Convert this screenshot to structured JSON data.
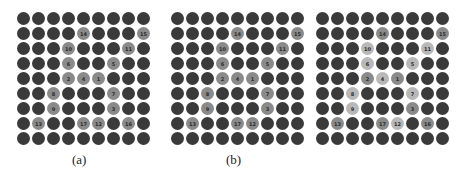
{
  "figure": {
    "grid_size": 9,
    "panels": [
      {
        "id": "a",
        "caption": "(a)",
        "left": 17,
        "highlighted": [
          {
            "row": 1,
            "col": 4,
            "label": "14",
            "shade": "medium"
          },
          {
            "row": 1,
            "col": 8,
            "label": "15",
            "shade": "medium"
          },
          {
            "row": 2,
            "col": 3,
            "label": "10",
            "shade": "medium"
          },
          {
            "row": 2,
            "col": 7,
            "label": "11",
            "shade": "medium"
          },
          {
            "row": 3,
            "col": 3,
            "label": "6",
            "shade": "medium"
          },
          {
            "row": 3,
            "col": 6,
            "label": "5",
            "shade": "medium"
          },
          {
            "row": 4,
            "col": 3,
            "label": "2",
            "shade": "medium"
          },
          {
            "row": 4,
            "col": 4,
            "label": "4",
            "shade": "medium"
          },
          {
            "row": 4,
            "col": 5,
            "label": "1",
            "shade": "medium"
          },
          {
            "row": 5,
            "col": 2,
            "label": "8",
            "shade": "medium"
          },
          {
            "row": 5,
            "col": 6,
            "label": "7",
            "shade": "medium"
          },
          {
            "row": 6,
            "col": 2,
            "label": "9",
            "shade": "medium"
          },
          {
            "row": 6,
            "col": 6,
            "label": "3",
            "shade": "medium"
          },
          {
            "row": 7,
            "col": 1,
            "label": "13",
            "shade": "medium"
          },
          {
            "row": 7,
            "col": 4,
            "label": "17",
            "shade": "medium"
          },
          {
            "row": 7,
            "col": 5,
            "label": "12",
            "shade": "medium"
          },
          {
            "row": 7,
            "col": 7,
            "label": "16",
            "shade": "medium"
          }
        ]
      },
      {
        "id": "b",
        "caption": "(b)",
        "left": 171,
        "highlighted": [
          {
            "row": 1,
            "col": 4,
            "label": "14",
            "shade": "medium"
          },
          {
            "row": 1,
            "col": 8,
            "label": "15",
            "shade": "medium"
          },
          {
            "row": 2,
            "col": 3,
            "label": "10",
            "shade": "medium"
          },
          {
            "row": 2,
            "col": 7,
            "label": "11",
            "shade": "medium"
          },
          {
            "row": 3,
            "col": 3,
            "label": "6",
            "shade": "medium"
          },
          {
            "row": 3,
            "col": 6,
            "label": "5",
            "shade": "medium"
          },
          {
            "row": 4,
            "col": 3,
            "label": "2",
            "shade": "medium"
          },
          {
            "row": 4,
            "col": 4,
            "label": "4",
            "shade": "medium"
          },
          {
            "row": 4,
            "col": 5,
            "label": "1",
            "shade": "medium"
          },
          {
            "row": 5,
            "col": 2,
            "label": "8",
            "shade": "medium"
          },
          {
            "row": 5,
            "col": 6,
            "label": "7",
            "shade": "medium"
          },
          {
            "row": 6,
            "col": 2,
            "label": "9",
            "shade": "medium"
          },
          {
            "row": 6,
            "col": 6,
            "label": "3",
            "shade": "medium"
          },
          {
            "row": 7,
            "col": 1,
            "label": "13",
            "shade": "medium"
          },
          {
            "row": 7,
            "col": 4,
            "label": "17",
            "shade": "medium"
          },
          {
            "row": 7,
            "col": 5,
            "label": "12",
            "shade": "medium"
          }
        ]
      },
      {
        "id": "c",
        "caption": "",
        "left": 316,
        "highlighted": [
          {
            "row": 1,
            "col": 4,
            "label": "14",
            "shade": "medium"
          },
          {
            "row": 1,
            "col": 8,
            "label": "15",
            "shade": "medium"
          },
          {
            "row": 2,
            "col": 3,
            "label": "10",
            "shade": "light"
          },
          {
            "row": 2,
            "col": 7,
            "label": "11",
            "shade": "light"
          },
          {
            "row": 3,
            "col": 3,
            "label": "6",
            "shade": "light"
          },
          {
            "row": 3,
            "col": 6,
            "label": "5",
            "shade": "light"
          },
          {
            "row": 4,
            "col": 3,
            "label": "2",
            "shade": "medium"
          },
          {
            "row": 4,
            "col": 4,
            "label": "4",
            "shade": "light"
          },
          {
            "row": 4,
            "col": 5,
            "label": "1",
            "shade": "medium"
          },
          {
            "row": 5,
            "col": 2,
            "label": "8",
            "shade": "light"
          },
          {
            "row": 5,
            "col": 6,
            "label": "7",
            "shade": "light"
          },
          {
            "row": 6,
            "col": 2,
            "label": "9",
            "shade": "light"
          },
          {
            "row": 6,
            "col": 6,
            "label": "3",
            "shade": "medium"
          },
          {
            "row": 7,
            "col": 1,
            "label": "13",
            "shade": "medium"
          },
          {
            "row": 7,
            "col": 4,
            "label": "17",
            "shade": "medium"
          },
          {
            "row": 7,
            "col": 5,
            "label": "12",
            "shade": "light"
          },
          {
            "row": 7,
            "col": 7,
            "label": "16",
            "shade": "medium"
          }
        ]
      }
    ],
    "colors": {
      "dark": "#3a3a3a",
      "medium": "#8a8a8a",
      "light": "#b8b8b8",
      "background": "#ffffff"
    }
  }
}
